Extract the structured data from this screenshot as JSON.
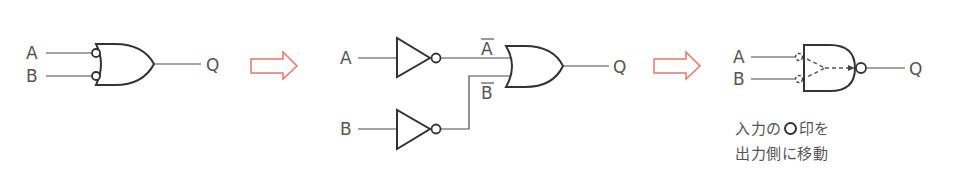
{
  "diagram": {
    "stage1": {
      "title": "NOR-like OR gate with inverted inputs",
      "inputs": [
        "A",
        "B"
      ],
      "output": "Q",
      "gate": "OR with inverted (bubbled) inputs"
    },
    "arrow1": {
      "icon": "right-arrow-icon",
      "color": "#e07a6e"
    },
    "stage2": {
      "inputs": [
        "A",
        "B"
      ],
      "inverted_labels": {
        "a_bar": "A",
        "b_bar": "B"
      },
      "output": "Q",
      "gates": [
        "NOT",
        "NOT",
        "OR"
      ]
    },
    "arrow2": {
      "icon": "right-arrow-icon",
      "color": "#e07a6e"
    },
    "stage3": {
      "inputs": [
        "A",
        "B"
      ],
      "output": "Q",
      "gate": "NAND (bubbles moved from inputs to output)",
      "note_line1_pre": "入力の",
      "note_line1_post": "印を",
      "note_line2": "出力側に移動"
    }
  },
  "colors": {
    "line": "#333333",
    "text": "#555555",
    "arrow": "#e07a6e"
  }
}
